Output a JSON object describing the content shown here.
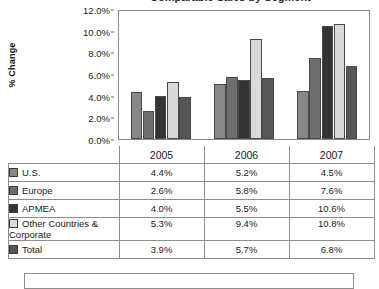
{
  "title": {
    "text": "Comparable Sales by Segment"
  },
  "chart_data": {
    "type": "bar",
    "title": "Comparable Sales by Segment",
    "xlabel": "",
    "ylabel": "% Change",
    "ylim": [
      0,
      12
    ],
    "ytick_labels": [
      "0.0%",
      "2.0%",
      "4.0%",
      "6.0%",
      "8.0%",
      "10.0%",
      "12.0%"
    ],
    "ytick_values": [
      0,
      2,
      4,
      6,
      8,
      10,
      12
    ],
    "grid": false,
    "legend_position": "table-below",
    "categories": [
      "2005",
      "2006",
      "2007"
    ],
    "series": [
      {
        "name": "U.S.",
        "values": [
          4.4,
          5.2,
          4.5
        ],
        "labels": [
          "4.4%",
          "5.2%",
          "4.5%"
        ],
        "color": "#878787"
      },
      {
        "name": "Europe",
        "values": [
          2.6,
          5.8,
          7.6
        ],
        "labels": [
          "2.6%",
          "5.8%",
          "7.6%"
        ],
        "color": "#6e6e6e"
      },
      {
        "name": "APMEA",
        "values": [
          4.0,
          5.5,
          10.6
        ],
        "labels": [
          "4.0%",
          "5.5%",
          "10.6%"
        ],
        "color": "#333333"
      },
      {
        "name": "Other Countries & Corporate",
        "values": [
          5.3,
          9.4,
          10.8
        ],
        "labels": [
          "5.3%",
          "9.4%",
          "10.8%"
        ],
        "color": "#d9d9d9"
      },
      {
        "name": "Total",
        "values": [
          3.9,
          5.7,
          6.8
        ],
        "labels": [
          "3.9%",
          "5.7%",
          "6.8%"
        ],
        "color": "#565656"
      }
    ]
  },
  "table": {
    "header": [
      "",
      "2005",
      "2006",
      "2007"
    ],
    "rows": [
      {
        "label": "U.S.",
        "swatch": "#878787",
        "values": [
          "4.4%",
          "5.2%",
          "4.5%"
        ]
      },
      {
        "label": "Europe",
        "swatch": "#6e6e6e",
        "values": [
          "2.6%",
          "5.8%",
          "7.6%"
        ]
      },
      {
        "label": "APMEA",
        "swatch": "#333333",
        "values": [
          "4.0%",
          "5.5%",
          "10.6%"
        ]
      },
      {
        "label": "Other Countries & Corporate",
        "swatch": "#d9d9d9",
        "values": [
          "5.3%",
          "9.4%",
          "10.8%"
        ]
      },
      {
        "label": "Total",
        "swatch": "#565656",
        "values": [
          "3.9%",
          "5.7%",
          "6.8%"
        ]
      }
    ]
  }
}
